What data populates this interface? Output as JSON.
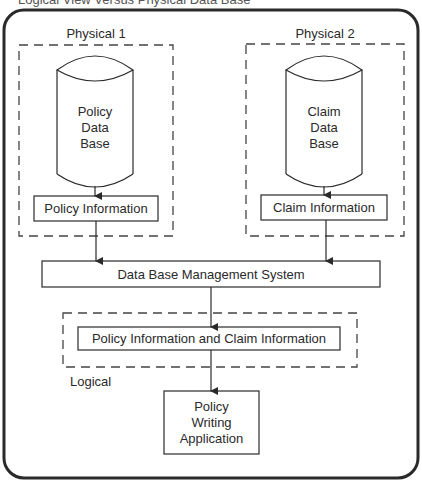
{
  "figure": {
    "title": "Logical View Versus Physical Data Base"
  },
  "groups": {
    "physical1": {
      "label": "Physical 1"
    },
    "physical2": {
      "label": "Physical 2"
    },
    "logical": {
      "label": "Logical"
    }
  },
  "nodes": {
    "policy_db": {
      "line1": "Policy",
      "line2": "Data",
      "line3": "Base"
    },
    "claim_db": {
      "line1": "Claim",
      "line2": "Data",
      "line3": "Base"
    },
    "policy_info": {
      "label": "Policy Information"
    },
    "claim_info": {
      "label": "Claim Information"
    },
    "dbms": {
      "label": "Data Base Management System"
    },
    "combined_info": {
      "label": "Policy Information and Claim Information"
    },
    "app": {
      "line1": "Policy",
      "line2": "Writing",
      "line3": "Application"
    }
  },
  "edges": [
    {
      "from": "Policy Data Base",
      "to": "Policy Information"
    },
    {
      "from": "Claim Data Base",
      "to": "Claim Information"
    },
    {
      "from": "Policy Information",
      "to": "Data Base Management System"
    },
    {
      "from": "Claim Information",
      "to": "Data Base Management System"
    },
    {
      "from": "Data Base Management System",
      "to": "Policy Information and Claim Information"
    },
    {
      "from": "Policy Information and Claim Information",
      "to": "Policy Writing Application"
    }
  ],
  "colors": {
    "stroke": "#2a2a2a",
    "background": "#ffffff"
  }
}
